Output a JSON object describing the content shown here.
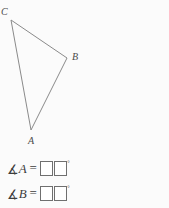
{
  "figure": {
    "type": "triangle",
    "stroke_color": "#8a8a8a",
    "background_color": "#fbfbfb",
    "vertices": [
      {
        "id": "C",
        "label": "C",
        "x": 11,
        "y": 20
      },
      {
        "id": "B",
        "label": "B",
        "x": 67,
        "y": 58
      },
      {
        "id": "A",
        "label": "A",
        "x": 31,
        "y": 130
      }
    ],
    "edges": [
      {
        "from": "C",
        "to": "B"
      },
      {
        "from": "B",
        "to": "A"
      },
      {
        "from": "A",
        "to": "C"
      }
    ]
  },
  "questions": [
    {
      "id": "angle-A",
      "angle_symbol": "∡",
      "variable": "A",
      "equals": "=",
      "degree_symbol": "°",
      "inputs": [
        {
          "id": "angle-A-tens",
          "value": "",
          "placeholder": ""
        },
        {
          "id": "angle-A-ones",
          "value": "",
          "placeholder": ""
        }
      ]
    },
    {
      "id": "angle-B",
      "angle_symbol": "∡",
      "variable": "B",
      "equals": "=",
      "degree_symbol": "°",
      "inputs": [
        {
          "id": "angle-B-tens",
          "value": "",
          "placeholder": ""
        },
        {
          "id": "angle-B-ones",
          "value": "",
          "placeholder": ""
        }
      ]
    }
  ]
}
